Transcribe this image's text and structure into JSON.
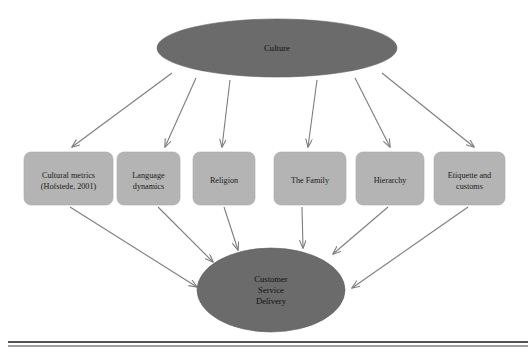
{
  "diagram": {
    "title_node": {
      "id": "culture",
      "label": "Culture",
      "shape": "ellipse",
      "fill": "#6b6b6b",
      "cx": 277,
      "cy": 48,
      "rx": 120,
      "ry": 29
    },
    "outcome_node": {
      "id": "customer-service-delivery",
      "label_lines": [
        "Customer",
        "Service",
        "Delivery"
      ],
      "label": "Customer Service Delivery",
      "shape": "ellipse",
      "fill": "#6b6b6b",
      "cx": 271,
      "cy": 290,
      "rx": 74,
      "ry": 42
    },
    "factors": [
      {
        "id": "cultural-metrics",
        "label_lines": [
          "Cultural metrics",
          "(Hofstede, 2001)"
        ],
        "label": "Cultural metrics (Hofstede, 2001)",
        "x": 24,
        "y": 152,
        "width": 89,
        "height": 53
      },
      {
        "id": "language-dynamics",
        "label_lines": [
          "Language",
          "dynamics"
        ],
        "label": "Language dynamics",
        "x": 117,
        "y": 152,
        "width": 63,
        "height": 53
      },
      {
        "id": "religion",
        "label_lines": [
          "Religion"
        ],
        "label": "Religion",
        "x": 193,
        "y": 152,
        "width": 62,
        "height": 53
      },
      {
        "id": "the-family",
        "label_lines": [
          "The Family"
        ],
        "label": "The Family",
        "x": 274,
        "y": 152,
        "width": 72,
        "height": 53
      },
      {
        "id": "hierarchy",
        "label_lines": [
          "Hierarchy"
        ],
        "label": "Hierarchy",
        "x": 356,
        "y": 152,
        "width": 68,
        "height": 53
      },
      {
        "id": "etiquette-and-customs",
        "label_lines": [
          "Etiquette and",
          "customs"
        ],
        "label": "Etiquette and customs",
        "x": 434,
        "y": 152,
        "width": 71,
        "height": 53
      }
    ],
    "edges_from_culture": [
      {
        "from": "culture",
        "to": "cultural-metrics",
        "x1": 172,
        "y1": 73,
        "x2": 72,
        "y2": 147
      },
      {
        "from": "culture",
        "to": "language-dynamics",
        "x1": 196,
        "y1": 78,
        "x2": 165,
        "y2": 147
      },
      {
        "from": "culture",
        "to": "religion",
        "x1": 230,
        "y1": 80,
        "x2": 222,
        "y2": 147
      },
      {
        "from": "culture",
        "to": "the-family",
        "x1": 317,
        "y1": 80,
        "x2": 308,
        "y2": 147
      },
      {
        "from": "culture",
        "to": "hierarchy",
        "x1": 355,
        "y1": 78,
        "x2": 390,
        "y2": 147
      },
      {
        "from": "culture",
        "to": "etiquette-and-customs",
        "x1": 382,
        "y1": 73,
        "x2": 474,
        "y2": 147
      }
    ],
    "edges_to_outcome": [
      {
        "from": "cultural-metrics",
        "to": "customer-service-delivery",
        "x1": 70,
        "y1": 207,
        "x2": 197,
        "y2": 287
      },
      {
        "from": "language-dynamics",
        "to": "customer-service-delivery",
        "x1": 158,
        "y1": 207,
        "x2": 213,
        "y2": 262
      },
      {
        "from": "religion",
        "to": "customer-service-delivery",
        "x1": 224,
        "y1": 207,
        "x2": 238,
        "y2": 250
      },
      {
        "from": "the-family",
        "to": "customer-service-delivery",
        "x1": 302,
        "y1": 207,
        "x2": 303,
        "y2": 248
      },
      {
        "from": "hierarchy",
        "to": "customer-service-delivery",
        "x1": 388,
        "y1": 207,
        "x2": 333,
        "y2": 254
      },
      {
        "from": "etiquette-and-customs",
        "to": "customer-service-delivery",
        "x1": 468,
        "y1": 207,
        "x2": 352,
        "y2": 288
      }
    ],
    "footer_rule": {
      "name": "horizontal-divider",
      "x1": 8,
      "x2": 528,
      "y_thick": 342,
      "y_thin": 346
    },
    "colors": {
      "ellipse_fill": "#6b6b6b",
      "box_fill": "#b4b4b4",
      "arrow": "#7d7d7d",
      "text": "#1a1a1a",
      "rule": "#1b1b1b",
      "background": "#ffffff"
    }
  }
}
